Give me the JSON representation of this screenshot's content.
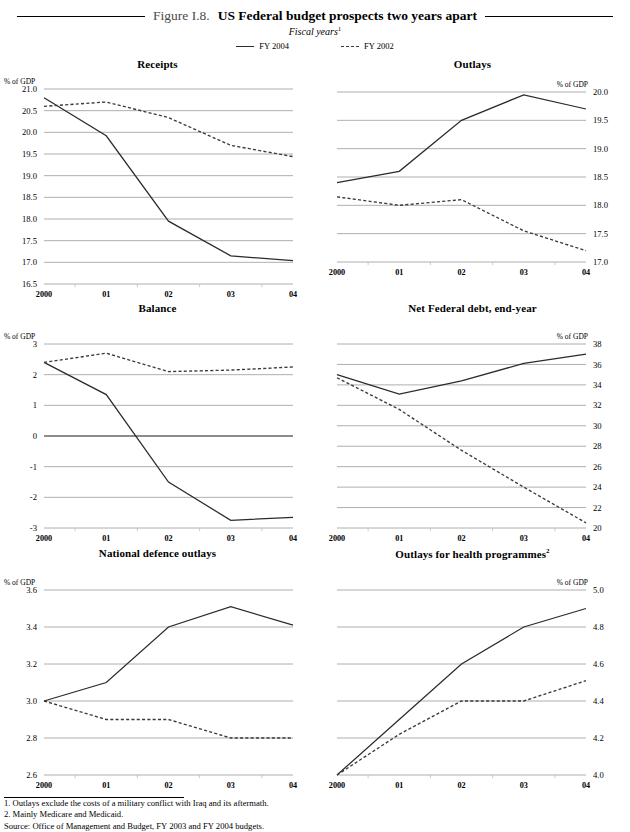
{
  "figure": {
    "number": "Figure I.8.",
    "title": "US Federal budget prospects two years apart",
    "subtitle": "Fiscal years",
    "subtitle_footnote": "1"
  },
  "legend": {
    "position": "top-center",
    "items": [
      {
        "label": "FY 2004",
        "style": "solid",
        "color": "#2b2b2b"
      },
      {
        "label": "FY 2002",
        "style": "dotted",
        "color": "#3a3a3a"
      }
    ]
  },
  "axis_unit_label": "% of GDP",
  "footnotes": [
    "1. Outlays exclude the costs of a military conflict with Iraq and its aftermath.",
    "2. Mainly Medicare and Medicaid.",
    "Source: Office of Management and Budget, FY 2003 and FY 2004 budgets."
  ],
  "chart_data": [
    {
      "id": "receipts",
      "type": "line",
      "title": "Receipts",
      "title_footnote": "",
      "xlabel": "",
      "ylabel": "% of GDP",
      "ylabel_side": "left",
      "ytick_side": "left",
      "grid": true,
      "x": [
        "2000",
        "01",
        "02",
        "03",
        "04"
      ],
      "categories": [
        "2000",
        "01",
        "02",
        "03",
        "04"
      ],
      "ylim": [
        16.5,
        21.0
      ],
      "yticks": [
        21.0,
        20.5,
        20.0,
        19.5,
        19.0,
        18.5,
        18.0,
        17.5,
        17.0,
        16.5
      ],
      "ytick_labels": [
        "21.0",
        "20.5",
        "20.0",
        "19.5",
        "19.0",
        "18.5",
        "18.0",
        "17.5",
        "17.0",
        "16.5"
      ],
      "series": [
        {
          "name": "FY 2004",
          "style": "solid",
          "values": [
            20.8,
            19.92,
            17.95,
            17.15,
            17.04
          ]
        },
        {
          "name": "FY 2002",
          "style": "dotted",
          "values": [
            20.6,
            20.7,
            20.34,
            19.7,
            19.44
          ]
        }
      ]
    },
    {
      "id": "outlays",
      "type": "line",
      "title": "Outlays",
      "title_footnote": "",
      "xlabel": "",
      "ylabel": "% of GDP",
      "ylabel_side": "right",
      "ytick_side": "right",
      "grid": true,
      "x": [
        "2000",
        "01",
        "02",
        "03",
        "04"
      ],
      "categories": [
        "2000",
        "01",
        "02",
        "03",
        "04"
      ],
      "ylim": [
        17.0,
        20.0
      ],
      "yticks": [
        20.0,
        19.5,
        19.0,
        18.5,
        18.0,
        17.5,
        17.0
      ],
      "ytick_labels": [
        "20.0",
        "19.5",
        "19.0",
        "18.5",
        "18.0",
        "17.5",
        "17.0"
      ],
      "series": [
        {
          "name": "FY 2004",
          "style": "solid",
          "values": [
            18.4,
            18.6,
            19.5,
            19.95,
            19.7
          ]
        },
        {
          "name": "FY 2002",
          "style": "dotted",
          "values": [
            18.15,
            18.0,
            18.1,
            17.55,
            17.2
          ]
        }
      ]
    },
    {
      "id": "balance",
      "type": "line",
      "title": "Balance",
      "title_footnote": "",
      "xlabel": "",
      "ylabel": "% of GDP",
      "ylabel_side": "left",
      "ytick_side": "left",
      "grid": true,
      "zero_line": 0,
      "x": [
        "2000",
        "01",
        "02",
        "03",
        "04"
      ],
      "categories": [
        "2000",
        "01",
        "02",
        "03",
        "04"
      ],
      "ylim": [
        -3,
        3
      ],
      "yticks": [
        3,
        2,
        1,
        0,
        -1,
        -2,
        -3
      ],
      "ytick_labels": [
        "3",
        "2",
        "1",
        "0",
        "-1",
        "-2",
        "-3"
      ],
      "series": [
        {
          "name": "FY 2004",
          "style": "solid",
          "values": [
            2.4,
            1.35,
            -1.5,
            -2.75,
            -2.65
          ]
        },
        {
          "name": "FY 2002",
          "style": "dotted",
          "values": [
            2.4,
            2.7,
            2.1,
            2.15,
            2.25
          ]
        }
      ]
    },
    {
      "id": "net-federal-debt",
      "type": "line",
      "title": "Net Federal debt, end-year",
      "title_footnote": "",
      "xlabel": "",
      "ylabel": "% of GDP",
      "ylabel_side": "right",
      "ytick_side": "right",
      "grid": true,
      "x": [
        "2000",
        "01",
        "02",
        "03",
        "04"
      ],
      "categories": [
        "2000",
        "01",
        "02",
        "03",
        "04"
      ],
      "ylim": [
        20,
        38
      ],
      "yticks": [
        38,
        36,
        34,
        32,
        30,
        28,
        26,
        24,
        22,
        20
      ],
      "ytick_labels": [
        "38",
        "36",
        "34",
        "32",
        "30",
        "28",
        "26",
        "24",
        "22",
        "20"
      ],
      "series": [
        {
          "name": "FY 2004",
          "style": "solid",
          "values": [
            35.0,
            33.1,
            34.4,
            36.1,
            37.0
          ]
        },
        {
          "name": "FY 2002",
          "style": "dotted",
          "values": [
            34.7,
            31.6,
            27.6,
            24.0,
            20.5
          ]
        }
      ]
    },
    {
      "id": "national-defence-outlays",
      "type": "line",
      "title": "National defence outlays",
      "title_footnote": "",
      "xlabel": "",
      "ylabel": "% of GDP",
      "ylabel_side": "left",
      "ytick_side": "left",
      "grid": true,
      "x": [
        "2000",
        "01",
        "02",
        "03",
        "04"
      ],
      "categories": [
        "2000",
        "01",
        "02",
        "03",
        "04"
      ],
      "ylim": [
        2.6,
        3.6
      ],
      "yticks": [
        3.6,
        3.4,
        3.2,
        3.0,
        2.8,
        2.6
      ],
      "ytick_labels": [
        "3.6",
        "3.4",
        "3.2",
        "3.0",
        "2.8",
        "2.6"
      ],
      "series": [
        {
          "name": "FY 2004",
          "style": "solid",
          "values": [
            3.0,
            3.1,
            3.4,
            3.51,
            3.41
          ]
        },
        {
          "name": "FY 2002",
          "style": "dotted",
          "values": [
            3.0,
            2.9,
            2.9,
            2.8,
            2.8
          ]
        }
      ]
    },
    {
      "id": "outlays-health-programmes",
      "type": "line",
      "title": "Outlays for health programmes",
      "title_footnote": "2",
      "xlabel": "",
      "ylabel": "% of GDP",
      "ylabel_side": "right",
      "ytick_side": "right",
      "grid": true,
      "x": [
        "2000",
        "01",
        "02",
        "03",
        "04"
      ],
      "categories": [
        "2000",
        "01",
        "02",
        "03",
        "04"
      ],
      "ylim": [
        4.0,
        5.0
      ],
      "yticks": [
        5.0,
        4.8,
        4.6,
        4.4,
        4.2,
        4.0
      ],
      "ytick_labels": [
        "5.0",
        "4.8",
        "4.6",
        "4.4",
        "4.2",
        "4.0"
      ],
      "series": [
        {
          "name": "FY 2004",
          "style": "solid",
          "values": [
            4.0,
            4.3,
            4.6,
            4.8,
            4.9
          ]
        },
        {
          "name": "FY 2002",
          "style": "dotted",
          "values": [
            4.0,
            4.22,
            4.4,
            4.4,
            4.51
          ]
        }
      ]
    }
  ]
}
